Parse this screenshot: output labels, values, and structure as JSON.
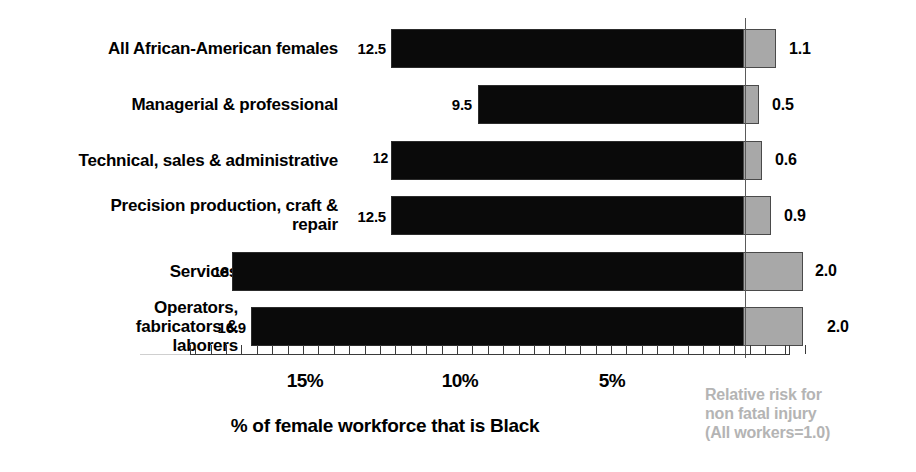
{
  "chart_data": {
    "type": "bar",
    "title": "",
    "orientation": "horizontal",
    "xlabel": "% of female workforce that is Black",
    "ylabel": "",
    "categories": [
      "All African-American females",
      "Managerial & professional",
      "Technical, sales & administrative",
      "Precision production, craft &\nrepair",
      "Services",
      "Operators,\nfabricators &\nlaborers"
    ],
    "series": [
      {
        "name": "% of female workforce that is Black",
        "color": "#0a0a0a",
        "values": [
          12.5,
          9.5,
          12,
          12.5,
          18,
          16.9
        ],
        "value_labels": [
          "12.5",
          "9.5",
          "12",
          "12.5",
          "18",
          "16.9"
        ],
        "axis": "percent"
      },
      {
        "name": "Relative risk for non fatal injury (All workers=1.0)",
        "color": "#a8a8a8",
        "values": [
          1.1,
          0.5,
          0.6,
          0.9,
          2.0,
          2.0
        ],
        "value_labels": [
          "1.1",
          "0.5",
          "0.6",
          "0.9",
          "2.0",
          "2.0"
        ],
        "axis": "relative_risk"
      }
    ],
    "xaxis": {
      "tick_labels": [
        "15%",
        "10%",
        "5%"
      ],
      "tick_values": [
        15,
        10,
        5
      ],
      "direction": "descending-left-to-right",
      "range": [
        19,
        0
      ],
      "minor_ticks": true,
      "grid": false
    },
    "reference_line": {
      "label": "All workers=1.0",
      "value": 0
    },
    "legend": {
      "position": "bottom-right",
      "note": "Relative risk for\nnon fatal injury\n(All workers=1.0)",
      "note_color": "#b4b4b4"
    }
  },
  "axis_title": "% of female workforce that is Black",
  "legend_note": "Relative risk for\nnon fatal injury\n(All workers=1.0)"
}
